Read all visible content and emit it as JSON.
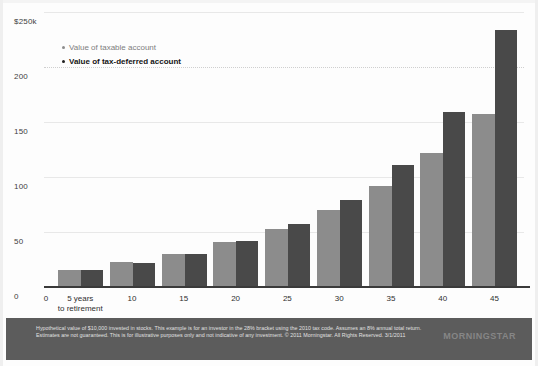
{
  "chart_data": {
    "type": "bar",
    "title": "",
    "xlabel": "",
    "ylabel": "",
    "ylim": [
      0,
      250
    ],
    "y_unit": "thousands of dollars",
    "grid": true,
    "legend_position": "top-left",
    "categories": [
      "5 years\nto retirement",
      "10",
      "15",
      "20",
      "25",
      "30",
      "35",
      "40",
      "45"
    ],
    "x_tick_labels": [
      "0",
      "5 years",
      "10",
      "15",
      "20",
      "25",
      "30",
      "35",
      "40",
      "45"
    ],
    "x_tick_sublabel": "to retirement",
    "y_tick_labels": [
      "$250k",
      "200",
      "150",
      "100",
      "50",
      "0"
    ],
    "y_tick_values": [
      250,
      200,
      150,
      100,
      50,
      0
    ],
    "series": [
      {
        "name": "Value of taxable account",
        "color": "#8c8c8c",
        "values": [
          15,
          23,
          30,
          41,
          53,
          70,
          92,
          122,
          157
        ]
      },
      {
        "name": "Value of tax-deferred account",
        "color": "#494949",
        "values": [
          15,
          22,
          30,
          42,
          57,
          79,
          111,
          159,
          234
        ]
      }
    ]
  },
  "legend": {
    "items": [
      {
        "label": "Value of taxable account",
        "color": "#8c8c8c"
      },
      {
        "label": "Value of tax-deferred account",
        "color": "#202020"
      }
    ]
  },
  "footer": {
    "note": "Hypothetical value of $10,000 invested in stocks. This example is for an investor in the 28% bracket using the 2010 tax code. Assumes an 8% annual total return. Estimates are not guaranteed. This is for illustrative purposes only and not indicative of any investment. © 2011 Morningstar. All Rights Reserved. 3/1/2011",
    "logo": "MORNINGSTAR",
    "background": "#5c5c5c"
  }
}
